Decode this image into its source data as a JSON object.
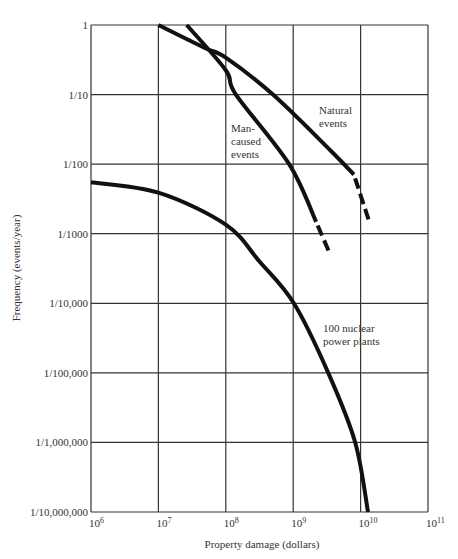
{
  "chart_data": {
    "type": "line",
    "title": "",
    "xlabel": "Property damage (dollars)",
    "ylabel": "Frequency (events/year)",
    "x_scale": "log",
    "y_scale": "log",
    "xlim_log10": [
      6,
      11
    ],
    "ylim_log10": [
      -7,
      0
    ],
    "grid": true,
    "x_ticks": [
      "10^6",
      "10^7",
      "10^8",
      "10^9",
      "10^10",
      "10^11"
    ],
    "y_ticks": [
      "1",
      "1/10",
      "1/100",
      "1/1000",
      "1/10,000",
      "1/100,000",
      "1/1,000,000",
      "1/10,000,000"
    ],
    "series": [
      {
        "name": "Natural events",
        "label_lines": [
          "Natural",
          "events"
        ],
        "points_log10": [
          [
            7.0,
            0.0
          ],
          [
            7.69,
            -0.33
          ],
          [
            8.0,
            -0.47
          ],
          [
            8.7,
            -1.0
          ],
          [
            9.55,
            -1.8
          ],
          [
            9.9,
            -2.15
          ]
        ],
        "dashed_extension_log10": [
          [
            9.9,
            -2.15
          ],
          [
            10.14,
            -2.86
          ]
        ]
      },
      {
        "name": "Man-caused events",
        "label_lines": [
          "Man-",
          "caused",
          "events"
        ],
        "points_log10": [
          [
            7.42,
            0.0
          ],
          [
            8.0,
            -0.65
          ],
          [
            8.15,
            -1.0
          ],
          [
            8.94,
            -2.0
          ],
          [
            9.34,
            -2.83
          ]
        ],
        "dashed_extension_log10": [
          [
            9.34,
            -2.83
          ],
          [
            9.55,
            -3.3
          ]
        ]
      },
      {
        "name": "100 nuclear power plants",
        "label_lines": [
          "100 nuclear",
          "power plants"
        ],
        "points_log10": [
          [
            6.0,
            -2.26
          ],
          [
            7.0,
            -2.41
          ],
          [
            8.0,
            -2.87
          ],
          [
            8.5,
            -3.4
          ],
          [
            9.01,
            -4.0
          ],
          [
            9.52,
            -5.0
          ],
          [
            9.92,
            -6.0
          ],
          [
            10.11,
            -7.0
          ]
        ],
        "dashed_extension_log10": []
      }
    ]
  },
  "axis": {
    "xlabel": "Property damage (dollars)",
    "ylabel": "Frequency (events/year)",
    "x_ticks": [
      {
        "base": "10",
        "exp": "6"
      },
      {
        "base": "10",
        "exp": "7"
      },
      {
        "base": "10",
        "exp": "8"
      },
      {
        "base": "10",
        "exp": "9"
      },
      {
        "base": "10",
        "exp": "10"
      },
      {
        "base": "10",
        "exp": "11"
      }
    ],
    "y_ticks": [
      "1",
      "1/10",
      "1/100",
      "1/1000",
      "1/10,000",
      "1/100,000",
      "1/1,000,000",
      "1/10,000,000"
    ]
  },
  "labels": {
    "natural": [
      "Natural",
      "events"
    ],
    "man": [
      "Man-",
      "caused",
      "events"
    ],
    "nuclear": [
      "100 nuclear",
      "power plants"
    ]
  }
}
